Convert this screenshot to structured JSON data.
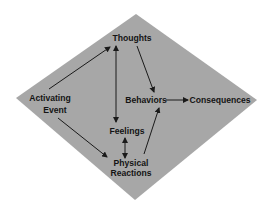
{
  "diagram": {
    "type": "cognitive-behavioral model",
    "background_shape": "diamond",
    "colors": {
      "diamond_fill": "#a7a7a7",
      "text": "#141414",
      "arrow": "#1a1a1a",
      "page_background": "#ffffff"
    },
    "nodes": {
      "activating_event": {
        "line1": "Activating",
        "line2": "Event"
      },
      "thoughts": {
        "label": "Thoughts"
      },
      "feelings": {
        "label": "Feelings"
      },
      "physical_reactions": {
        "line1": "Physical",
        "line2": "Reactions"
      },
      "behaviors": {
        "label": "Behaviors"
      },
      "consequences": {
        "label": "Consequences"
      }
    },
    "edges": [
      {
        "from": "Activating Event",
        "to": "Thoughts",
        "direction": "one-way"
      },
      {
        "from": "Activating Event",
        "to": "Physical Reactions",
        "direction": "one-way"
      },
      {
        "from": "Thoughts",
        "to": "Feelings",
        "direction": "two-way"
      },
      {
        "from": "Feelings",
        "to": "Physical Reactions",
        "direction": "two-way"
      },
      {
        "from": "Thoughts",
        "to": "Behaviors",
        "direction": "one-way"
      },
      {
        "from": "Physical Reactions",
        "to": "Behaviors",
        "direction": "one-way"
      },
      {
        "from": "Behaviors",
        "to": "Consequences",
        "direction": "one-way"
      }
    ]
  }
}
